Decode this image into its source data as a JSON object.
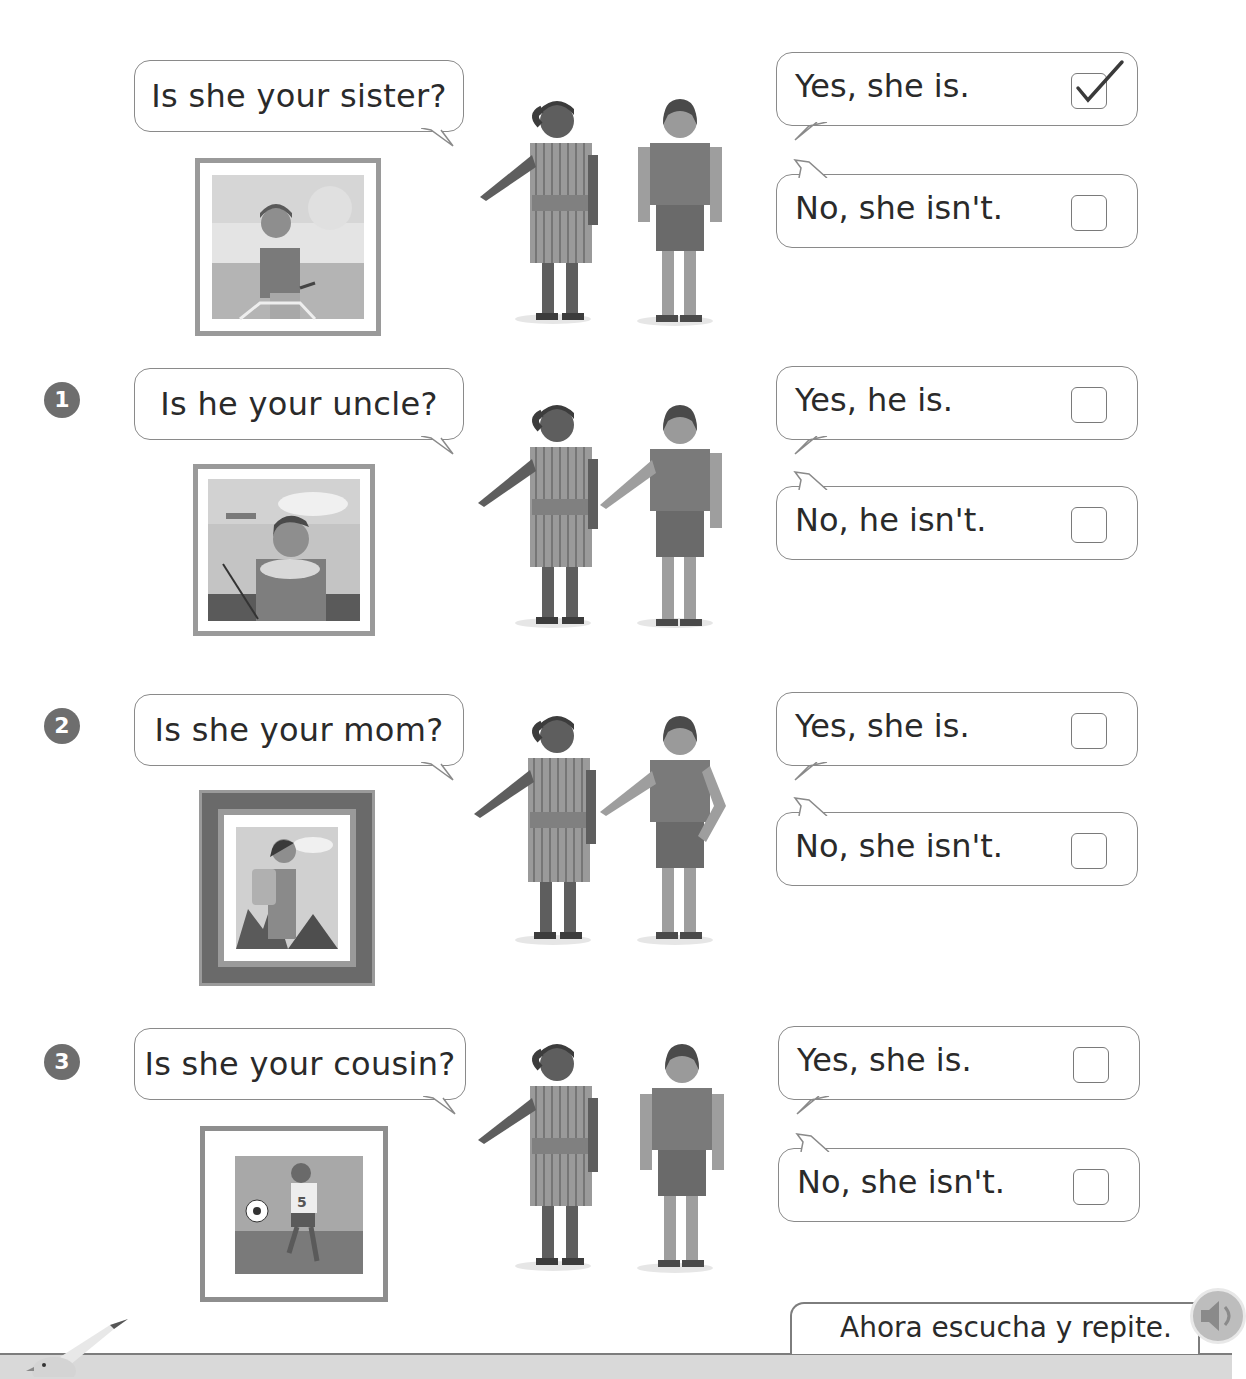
{
  "exercises": [
    {
      "number": "",
      "question": "Is she your sister?",
      "answers": [
        {
          "text": "Yes, she is.",
          "checked": true
        },
        {
          "text": "No, she isn't.",
          "checked": false
        }
      ],
      "photo": "girl-on-bicycle-photo",
      "example": true
    },
    {
      "number": "1",
      "question": "Is he your uncle?",
      "answers": [
        {
          "text": "Yes, he is.",
          "checked": false
        },
        {
          "text": "No, he isn't.",
          "checked": false
        }
      ],
      "photo": "boy-holding-fish-photo"
    },
    {
      "number": "2",
      "question": "Is she your mom?",
      "answers": [
        {
          "text": "Yes, she is.",
          "checked": false
        },
        {
          "text": "No, she isn't.",
          "checked": false
        }
      ],
      "photo": "woman-hiking-photo"
    },
    {
      "number": "3",
      "question": "Is she your cousin?",
      "answers": [
        {
          "text": "Yes, she is.",
          "checked": false
        },
        {
          "text": "No, she isn't.",
          "checked": false
        }
      ],
      "photo": "girl-playing-soccer-photo"
    }
  ],
  "footer": {
    "instruction": "Ahora escucha y repite.",
    "audio_icon": "speaker-icon"
  },
  "colors": {
    "border": "#8a8a8a",
    "number_badge": "#6e6e6e",
    "footer_bar": "#d9d9d9"
  }
}
